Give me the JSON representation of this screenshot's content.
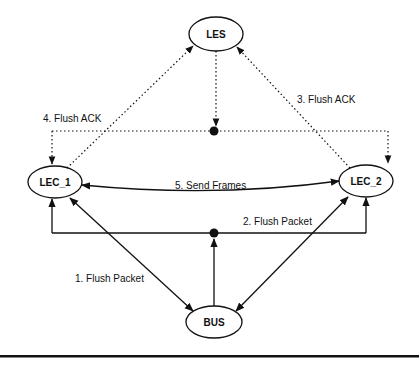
{
  "diagram": {
    "nodes": {
      "les": {
        "label": "LES"
      },
      "lec1": {
        "label": "LEC_1"
      },
      "lec2": {
        "label": "LEC_2"
      },
      "bus": {
        "label": "BUS"
      }
    },
    "edges": {
      "step1": {
        "label": "1.  Flush Packet",
        "from": "LEC_1",
        "to": "BUS",
        "style": "solid"
      },
      "step2": {
        "label": "2.  Flush Packet",
        "from": "BUS",
        "to": "LEC_1, LEC_2",
        "style": "solid"
      },
      "step3": {
        "label": "3.  Flush ACK",
        "from": "LEC_2",
        "to": "LES",
        "style": "dotted"
      },
      "step4": {
        "label": "4.  Flush ACK",
        "from": "LES",
        "to": "LEC_1, LEC_2",
        "style": "dotted"
      },
      "step5": {
        "label": "5.  Send Frames",
        "from": "LEC_1",
        "to": "LEC_2",
        "style": "solid"
      }
    },
    "colors": {
      "line": "#111111",
      "background": "#ffffff"
    }
  }
}
